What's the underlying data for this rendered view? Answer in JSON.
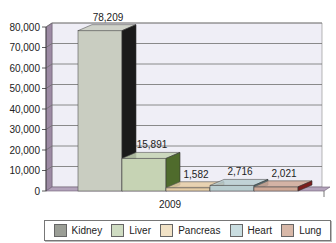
{
  "chart_data": {
    "type": "bar",
    "style": "3d-clustered-column",
    "title": "",
    "xlabel": "",
    "ylabel": "",
    "categories": [
      "2009"
    ],
    "series": [
      {
        "name": "Kidney",
        "values": [
          78209
        ],
        "label": "78,209",
        "color": "#c9cdc1",
        "side": "#1a1a1a"
      },
      {
        "name": "Liver",
        "values": [
          15891
        ],
        "label": "15,891",
        "color": "#c6d3b4",
        "side": "#4f6b2c"
      },
      {
        "name": "Pancreas",
        "values": [
          1582
        ],
        "label": "1,582",
        "color": "#e6cda6",
        "side": "#b98e5a"
      },
      {
        "name": "Heart",
        "values": [
          2716
        ],
        "label": "2,716",
        "color": "#b9cdd0",
        "side": "#4b6e73"
      },
      {
        "name": "Lung",
        "values": [
          2021
        ],
        "label": "2,021",
        "color": "#cfa896",
        "side": "#7b1d1d"
      }
    ],
    "yticks": [
      "0",
      "10,000",
      "20,000",
      "30,000",
      "40,000",
      "50,000",
      "60,000",
      "70,000",
      "80,000"
    ],
    "ylim": [
      0,
      80000
    ],
    "grid": true,
    "legend_position": "bottom"
  },
  "legend": {
    "items": [
      {
        "label": "Kidney",
        "color": "#9b9e96"
      },
      {
        "label": "Liver",
        "color": "#cfdcc2"
      },
      {
        "label": "Pancreas",
        "color": "#f1e2c6"
      },
      {
        "label": "Heart",
        "color": "#c9dde0"
      },
      {
        "label": "Lung",
        "color": "#d8b8a8"
      }
    ]
  }
}
